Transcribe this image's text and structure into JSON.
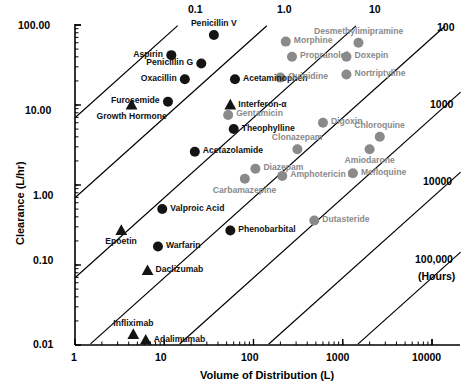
{
  "chart_data": {
    "type": "scatter",
    "title": "",
    "xlabel": "Volume of Distribution (L)",
    "ylabel": "Clearance (L/hr)",
    "xscale": "log",
    "yscale": "log",
    "xlim": [
      1,
      10000
    ],
    "ylim": [
      0.01,
      100
    ],
    "grid": false,
    "legend": null,
    "x_tick_labels": [
      "1",
      "10",
      "100",
      "1000",
      "10000"
    ],
    "x_tick_values": [
      1,
      10,
      100,
      1000,
      10000
    ],
    "y_tick_labels": [
      "0.01",
      "0.10",
      "1.00",
      "10.00",
      "100.00"
    ],
    "y_tick_values": [
      0.01,
      0.1,
      1,
      10,
      100
    ],
    "halflife_contours": {
      "note": "Diagonal iso-half-life lines, labelled in hours",
      "top_labels": [
        "0.1",
        "1.0",
        "10"
      ],
      "right_labels": [
        "100",
        "1000",
        "10000",
        "100,000"
      ],
      "unit_label": "(Hours)",
      "values_hours": [
        0.1,
        1.0,
        10,
        100,
        1000,
        10000,
        100000
      ]
    },
    "marker_types": {
      "circle-black": "small molecule drug",
      "circle-gray": "small molecule drug (gray)",
      "triangle-black": "protein / biologic"
    },
    "points": [
      {
        "name": "Penicillin V",
        "vd": 36,
        "cl": 75,
        "marker": "circle",
        "color": "black",
        "label_pos": "above"
      },
      {
        "name": "Aspirin",
        "vd": 12,
        "cl": 42,
        "marker": "circle",
        "color": "black",
        "label_pos": "left"
      },
      {
        "name": "Penicillin G",
        "vd": 26,
        "cl": 33,
        "marker": "circle",
        "color": "black",
        "label_pos": "left"
      },
      {
        "name": "Oxacillin",
        "vd": 17,
        "cl": 21,
        "marker": "circle",
        "color": "black",
        "label_pos": "left"
      },
      {
        "name": "Acetaminophen",
        "vd": 62,
        "cl": 21,
        "marker": "circle",
        "color": "black",
        "label_pos": "right"
      },
      {
        "name": "Morphine",
        "vd": 230,
        "cl": 62,
        "marker": "circle",
        "color": "gray",
        "label_pos": "right"
      },
      {
        "name": "Desmethylimipramine",
        "vd": 1500,
        "cl": 60,
        "marker": "circle",
        "color": "gray",
        "label_pos": "above"
      },
      {
        "name": "Doxepin",
        "vd": 1100,
        "cl": 40,
        "marker": "circle",
        "color": "gray",
        "label_pos": "right"
      },
      {
        "name": "Propranolol",
        "vd": 270,
        "cl": 40,
        "marker": "circle",
        "color": "gray",
        "label_pos": "right"
      },
      {
        "name": "Nortriptyline",
        "vd": 1100,
        "cl": 24,
        "marker": "circle",
        "color": "gray",
        "label_pos": "right"
      },
      {
        "name": "Quinidine",
        "vd": 200,
        "cl": 22,
        "marker": "circle",
        "color": "gray",
        "label_pos": "right"
      },
      {
        "name": "Furosemide",
        "vd": 11,
        "cl": 11,
        "marker": "circle",
        "color": "black",
        "label_pos": "left"
      },
      {
        "name": "Growth Hormone",
        "vd": 4.3,
        "cl": 10,
        "marker": "triangle",
        "color": "black",
        "label_pos": "below"
      },
      {
        "name": "Interferon-α",
        "vd": 55,
        "cl": 10,
        "marker": "triangle",
        "color": "black",
        "label_pos": "right"
      },
      {
        "name": "Gentamicin",
        "vd": 52,
        "cl": 7.5,
        "marker": "circle",
        "color": "gray",
        "label_pos": "right"
      },
      {
        "name": "Theophylline",
        "vd": 60,
        "cl": 5.0,
        "marker": "circle",
        "color": "black",
        "label_pos": "right"
      },
      {
        "name": "Digoxin",
        "vd": 600,
        "cl": 6.0,
        "marker": "circle",
        "color": "gray",
        "label_pos": "right"
      },
      {
        "name": "Chloroquine",
        "vd": 2600,
        "cl": 4.0,
        "marker": "circle",
        "color": "gray",
        "label_pos": "above"
      },
      {
        "name": "Acetazolamide",
        "vd": 22,
        "cl": 2.6,
        "marker": "circle",
        "color": "black",
        "label_pos": "right"
      },
      {
        "name": "Clonazepam",
        "vd": 310,
        "cl": 2.8,
        "marker": "circle",
        "color": "gray",
        "label_pos": "above"
      },
      {
        "name": "Amiodarone",
        "vd": 2000,
        "cl": 2.8,
        "marker": "circle",
        "color": "gray",
        "label_pos": "below"
      },
      {
        "name": "Diazepam",
        "vd": 105,
        "cl": 1.6,
        "marker": "circle",
        "color": "gray",
        "label_pos": "right"
      },
      {
        "name": "Carbamazepine",
        "vd": 80,
        "cl": 1.2,
        "marker": "circle",
        "color": "gray",
        "label_pos": "below"
      },
      {
        "name": "Amphotericin B",
        "vd": 210,
        "cl": 1.3,
        "marker": "circle",
        "color": "gray",
        "label_pos": "right"
      },
      {
        "name": "Mefloquine",
        "vd": 1300,
        "cl": 1.4,
        "marker": "circle",
        "color": "gray",
        "label_pos": "right"
      },
      {
        "name": "Valproic Acid",
        "vd": 9.5,
        "cl": 0.5,
        "marker": "circle",
        "color": "black",
        "label_pos": "right"
      },
      {
        "name": "Dutasteride",
        "vd": 480,
        "cl": 0.36,
        "marker": "circle",
        "color": "gray",
        "label_pos": "right"
      },
      {
        "name": "Phenobarbital",
        "vd": 55,
        "cl": 0.27,
        "marker": "circle",
        "color": "black",
        "label_pos": "right"
      },
      {
        "name": "Epoetin",
        "vd": 3.3,
        "cl": 0.27,
        "marker": "triangle",
        "color": "black",
        "label_pos": "below"
      },
      {
        "name": "Warfarin",
        "vd": 8.5,
        "cl": 0.17,
        "marker": "circle",
        "color": "black",
        "label_pos": "right"
      },
      {
        "name": "Daclizumab",
        "vd": 6.5,
        "cl": 0.085,
        "marker": "triangle",
        "color": "black",
        "label_pos": "right"
      },
      {
        "name": "Infliximab",
        "vd": 4.5,
        "cl": 0.0135,
        "marker": "triangle",
        "color": "black",
        "label_pos": "above"
      },
      {
        "name": "Adalimumab",
        "vd": 6.2,
        "cl": 0.0115,
        "marker": "triangle",
        "color": "black",
        "label_pos": "right"
      }
    ]
  },
  "axes": {
    "x_title": "Volume of Distribution (L)",
    "y_title": "Clearance (L/hr)",
    "x_ticks": [
      "1",
      "10",
      "100",
      "1000",
      "10000"
    ],
    "y_ticks": [
      "100.00",
      "10.00",
      "1.00",
      "0.10",
      "0.01"
    ]
  },
  "contour_labels": {
    "t_0_1": "0.1",
    "t_1_0": "1.0",
    "t_10": "10",
    "t_100": "100",
    "t_1000": "1000",
    "t_10000": "10000",
    "t_100000": "100,000",
    "units": "(Hours)"
  },
  "point_labels": {
    "penicillin_v": "Penicillin V",
    "aspirin": "Aspirin",
    "penicillin_g": "Penicillin G",
    "oxacillin": "Oxacillin",
    "acetaminophen": "Acetaminophen",
    "morphine": "Morphine",
    "desmethylimipramine": "Desmethylimipramine",
    "doxepin": "Doxepin",
    "propranolol": "Propranolol",
    "nortriptyline": "Nortriptyline",
    "quinidine": "Quinidine",
    "furosemide": "Furosemide",
    "growth_hormone": "Growth Hormone",
    "interferon_alpha": "Interferon-α",
    "gentamicin": "Gentamicin",
    "theophylline": "Theophylline",
    "digoxin": "Digoxin",
    "chloroquine": "Chloroquine",
    "acetazolamide": "Acetazolamide",
    "clonazepam": "Clonazepam",
    "amiodarone": "Amiodarone",
    "diazepam": "Diazepam",
    "carbamazepine": "Carbamazepine",
    "amphotericin_b": "Amphotericin B",
    "mefloquine": "Mefloquine",
    "valproic_acid": "Valproic Acid",
    "dutasteride": "Dutasteride",
    "phenobarbital": "Phenobarbital",
    "epoetin": "Epoetin",
    "warfarin": "Warfarin",
    "daclizumab": "Daclizumab",
    "infliximab": "Infliximab",
    "adalimumab": "Adalimumab"
  },
  "colors": {
    "black_marker": "#141414",
    "gray_marker": "#8a8a8a",
    "axis": "#000000",
    "background": "#ffffff"
  }
}
